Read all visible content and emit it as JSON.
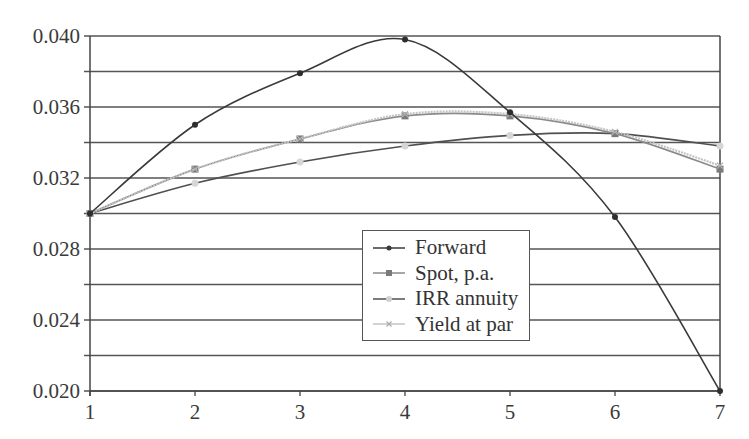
{
  "chart_data": {
    "type": "line",
    "title": "",
    "xlabel": "",
    "ylabel": "",
    "x": [
      1,
      2,
      3,
      4,
      5,
      6,
      7
    ],
    "xlim": [
      1,
      7
    ],
    "ylim": [
      0.02,
      0.04
    ],
    "x_ticks": [
      "1",
      "2",
      "3",
      "4",
      "5",
      "6",
      "7"
    ],
    "y_ticks": [
      "0.020",
      "0.024",
      "0.028",
      "0.032",
      "0.036",
      "0.040"
    ],
    "grid": {
      "horizontal": true,
      "step": 0.002
    },
    "legend_position": "inside-lower-center",
    "series": [
      {
        "name": "Forward",
        "color": "#3a3a3a",
        "marker": "diamond",
        "values": [
          0.03,
          0.035,
          0.0379,
          0.0398,
          0.0357,
          0.0298,
          0.02
        ]
      },
      {
        "name": "Spot, p.a.",
        "color": "#8a8a8a",
        "marker": "square",
        "values": [
          0.03,
          0.0325,
          0.0342,
          0.0355,
          0.0355,
          0.0345,
          0.0325
        ]
      },
      {
        "name": "IRR annuity",
        "color": "#505050",
        "marker": "circle",
        "values": [
          0.03,
          0.0317,
          0.0329,
          0.0338,
          0.0344,
          0.0345,
          0.0338
        ]
      },
      {
        "name": "Yield at par",
        "color": "#c4c4c4",
        "marker": "x",
        "values": [
          0.03,
          0.0325,
          0.0342,
          0.0356,
          0.0356,
          0.0346,
          0.0327
        ]
      }
    ]
  },
  "legend": {
    "items": [
      {
        "label": "Forward"
      },
      {
        "label": "Spot, p.a."
      },
      {
        "label": "IRR annuity"
      },
      {
        "label": "Yield at par"
      }
    ]
  }
}
